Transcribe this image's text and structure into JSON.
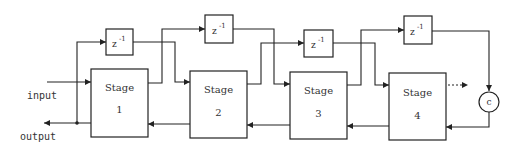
{
  "diagram": {
    "labels": {
      "input": "input",
      "output": "output",
      "multiplier": "c"
    },
    "stages": [
      {
        "title": "Stage",
        "number": "1"
      },
      {
        "title": "Stage",
        "number": "2"
      },
      {
        "title": "Stage",
        "number": "3"
      },
      {
        "title": "Stage",
        "number": "4"
      }
    ],
    "delays": [
      {
        "base": "z",
        "exponent": "-1"
      },
      {
        "base": "z",
        "exponent": "-1"
      },
      {
        "base": "z",
        "exponent": "-1"
      },
      {
        "base": "z",
        "exponent": "-1"
      }
    ],
    "continuation": "...",
    "colors": {
      "line": "#222222",
      "background": "#ffffff"
    }
  }
}
